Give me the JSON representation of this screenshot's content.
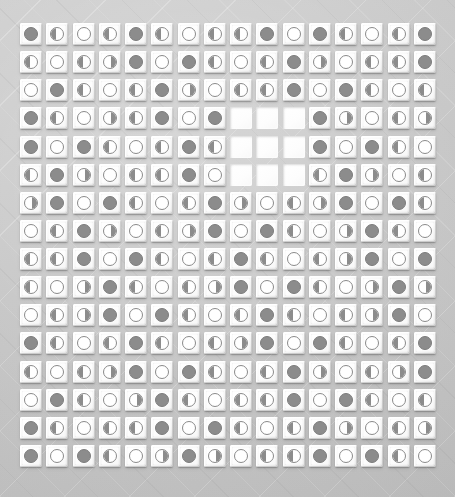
{
  "app": {
    "title": "Moon Phase Tile Grid",
    "surface_color": "#c6c6c6",
    "tile_color": "#ffffff",
    "token_dark_color": "#8c8c8c",
    "token_outline_color": "#8a8a8a"
  },
  "grid": {
    "rows": 16,
    "columns": 16,
    "tile_pitch_px": 26,
    "tile_size_px": 22,
    "empty_region": {
      "row_start": 4,
      "row_end": 6,
      "column_start": 9,
      "column_end": 11,
      "count": 9
    },
    "legend": [
      {
        "key": "full",
        "label": "Full",
        "glyph": "●"
      },
      {
        "key": "new",
        "label": "New",
        "glyph": "○"
      },
      {
        "key": "half-left",
        "label": "Last Quarter",
        "glyph": "◐"
      },
      {
        "key": "half-right",
        "label": "First Quarter",
        "glyph": "◑"
      },
      {
        "key": "waxing-gibbous",
        "label": "Waxing Gibbous",
        "glyph": "◕"
      },
      {
        "key": "waning-crescent",
        "label": "Waning Crescent",
        "glyph": "◔"
      },
      {
        "key": "empty",
        "label": "Empty Slot",
        "glyph": " "
      }
    ],
    "cells": [
      [
        "full",
        "half-left",
        "new",
        "half-left",
        "full",
        "half-left",
        "new",
        "half-left",
        "half-left",
        "full",
        "new",
        "full",
        "half-left",
        "new",
        "half-left",
        "full"
      ],
      [
        "half-left",
        "new",
        "half-left",
        "half-right",
        "full",
        "new",
        "full",
        "half-left",
        "new",
        "half-left",
        "full",
        "half-right",
        "new",
        "half-left",
        "half-left",
        "full"
      ],
      [
        "new",
        "full",
        "half-left",
        "new",
        "half-left",
        "full",
        "half-right",
        "new",
        "half-left",
        "half-left",
        "full",
        "new",
        "full",
        "half-left",
        "new",
        "half-left"
      ],
      [
        "full",
        "half-left",
        "new",
        "half-right",
        "half-left",
        "full",
        "new",
        "full",
        "empty",
        "empty",
        "empty",
        "full",
        "half-right",
        "new",
        "half-left",
        "half-right"
      ],
      [
        "full",
        "new",
        "full",
        "half-left",
        "new",
        "half-left",
        "full",
        "half-left",
        "empty",
        "empty",
        "empty",
        "full",
        "new",
        "full",
        "half-left",
        "new"
      ],
      [
        "half-left",
        "full",
        "half-right",
        "new",
        "half-left",
        "half-left",
        "full",
        "new",
        "empty",
        "empty",
        "empty",
        "half-left",
        "full",
        "half-right",
        "new",
        "half-left"
      ],
      [
        "half-right",
        "full",
        "new",
        "full",
        "half-left",
        "new",
        "half-left",
        "full",
        "half-right",
        "new",
        "half-left",
        "half-right",
        "full",
        "new",
        "full",
        "half-left"
      ],
      [
        "new",
        "half-left",
        "full",
        "half-right",
        "new",
        "half-left",
        "half-right",
        "full",
        "new",
        "full",
        "half-left",
        "new",
        "half-right",
        "full",
        "half-left",
        "new"
      ],
      [
        "half-left",
        "half-left",
        "full",
        "new",
        "full",
        "half-left",
        "new",
        "half-left",
        "full",
        "half-left",
        "new",
        "half-left",
        "half-right",
        "full",
        "new",
        "full"
      ],
      [
        "half-left",
        "new",
        "half-right",
        "full",
        "half-left",
        "new",
        "half-left",
        "half-right",
        "full",
        "new",
        "full",
        "half-left",
        "new",
        "half-right",
        "full",
        "half-right"
      ],
      [
        "new",
        "half-left",
        "half-right",
        "full",
        "new",
        "full",
        "half-left",
        "new",
        "half-left",
        "full",
        "half-left",
        "new",
        "half-left",
        "half-right",
        "full",
        "new"
      ],
      [
        "full",
        "half-left",
        "new",
        "half-left",
        "full",
        "half-left",
        "new",
        "half-left",
        "half-right",
        "full",
        "new",
        "full",
        "half-left",
        "new",
        "half-left",
        "full"
      ],
      [
        "half-left",
        "new",
        "half-left",
        "half-right",
        "full",
        "new",
        "full",
        "half-left",
        "new",
        "half-left",
        "full",
        "half-right",
        "new",
        "half-left",
        "half-right",
        "full"
      ],
      [
        "new",
        "full",
        "half-left",
        "new",
        "half-right",
        "full",
        "half-left",
        "new",
        "half-left",
        "half-left",
        "full",
        "new",
        "full",
        "half-left",
        "new",
        "half-left"
      ],
      [
        "full",
        "half-left",
        "new",
        "half-left",
        "half-left",
        "full",
        "new",
        "full",
        "half-left",
        "new",
        "half-left",
        "full",
        "half-right",
        "new",
        "half-left",
        "half-right"
      ],
      [
        "full",
        "new",
        "full",
        "half-left",
        "new",
        "half-right",
        "full",
        "half-right",
        "new",
        "half-left",
        "half-left",
        "full",
        "new",
        "full",
        "half-left",
        "new"
      ]
    ]
  }
}
